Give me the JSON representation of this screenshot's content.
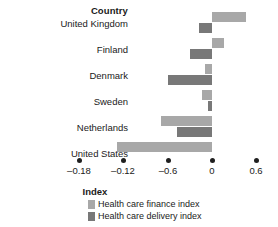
{
  "header": {
    "category_header": "Country"
  },
  "axis": {
    "title": "Index",
    "tick_labels": [
      "–0.18",
      "–0.12",
      "–0.6",
      "0",
      "0.6"
    ],
    "tick_values": [
      -0.18,
      -0.12,
      -0.06,
      0,
      0.06
    ]
  },
  "legend": {
    "items": [
      {
        "label": "Health care finance index",
        "color": "#a8a8a8"
      },
      {
        "label": "Health care delivery index",
        "color": "#787878"
      }
    ]
  },
  "colors": {
    "finance": "#a8a8a8",
    "delivery": "#787878",
    "text": "#1a1a1a",
    "background": "#ffffff"
  },
  "chart_data": {
    "type": "bar",
    "orientation": "horizontal",
    "title": "",
    "xlabel": "Index",
    "ylabel": "Country",
    "categories": [
      "United Kingdom",
      "Finland",
      "Denmark",
      "Sweden",
      "Netherlands",
      "United States"
    ],
    "series": [
      {
        "name": "Health care finance index",
        "color": "#a8a8a8",
        "values": [
          0.46,
          0.16,
          -0.09,
          -0.13,
          -0.69,
          -1.28
        ]
      },
      {
        "name": "Health care delivery index",
        "color": "#787878",
        "values": [
          -0.18,
          -0.3,
          -0.6,
          -0.05,
          -0.47,
          0.0
        ]
      }
    ],
    "xlim": [
      -1.32,
      0.6
    ],
    "grid": false,
    "legend_position": "bottom"
  }
}
